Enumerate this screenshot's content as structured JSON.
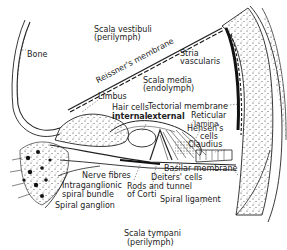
{
  "diagram": {
    "labels": {
      "scala_vestibuli": "Scala vestibuli",
      "scala_vestibuli_sub": "(perilymph)",
      "bone": "Bone",
      "reissners_membrane": "Reissner's membrane",
      "stria": "Stria",
      "vascularis": "vascularis",
      "scala_media": "Scala media",
      "scala_media_sub": "(endolymph)",
      "limbus": "Limbus",
      "hair_cells": "Hair cells",
      "internal": "internal",
      "external": "external",
      "tectorial_membrane": "Tectorial membrane",
      "reticular": "Reticular",
      "lamina": "lamina",
      "hensens": "Hensen's",
      "cells": "cells",
      "claudius": "Claudius",
      "basilar_membrane": "Basilar membrane",
      "nerve_fibres": "Nerve fibres",
      "deiters_cells": "Deiters' cells",
      "intraganglionic": "Intraganglionic",
      "spiral_bundle": "spiral bundle",
      "rods_and_tunnel": "Rods and tunnel",
      "of_corti": "of Corti",
      "spiral_ganglion": "Spiral ganglion",
      "spiral_ligament": "Spiral ligament",
      "scala_tympani": "Scala tympani",
      "scala_tympani_sub": "(perilymph)"
    },
    "colors": {
      "ink": "#222222",
      "background": "#ffffff"
    }
  }
}
